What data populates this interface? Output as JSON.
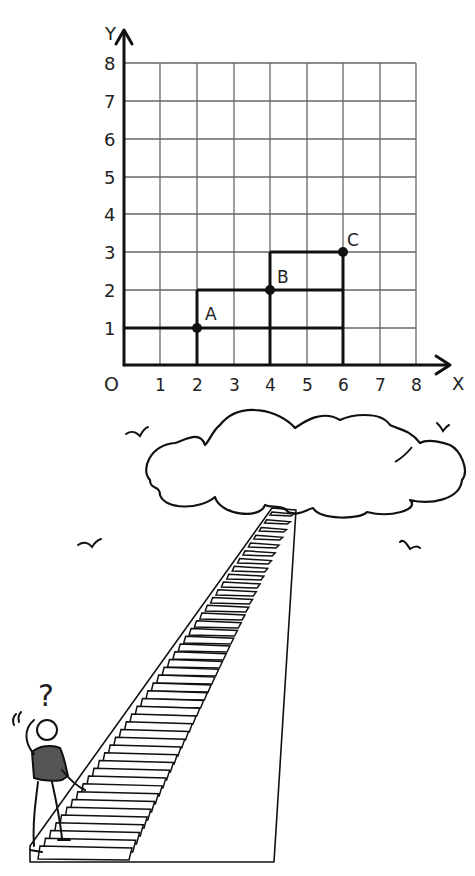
{
  "graph": {
    "axis_labels": {
      "x": "X",
      "y": "Y",
      "origin": "O"
    },
    "x_ticks": [
      "1",
      "2",
      "3",
      "4",
      "5",
      "6",
      "7",
      "8"
    ],
    "y_ticks": [
      "1",
      "2",
      "3",
      "4",
      "5",
      "6",
      "7",
      "8"
    ],
    "points": [
      {
        "label": "A",
        "x": 2,
        "y": 1
      },
      {
        "label": "B",
        "x": 4,
        "y": 2
      },
      {
        "label": "C",
        "x": 6,
        "y": 3
      }
    ]
  },
  "chart_data": {
    "type": "scatter",
    "title": "",
    "xlabel": "X",
    "ylabel": "Y",
    "xlim": [
      0,
      8
    ],
    "ylim": [
      0,
      8
    ],
    "grid": true,
    "x_tick_labels": [
      "O",
      "1",
      "2",
      "3",
      "4",
      "5",
      "6",
      "7",
      "8"
    ],
    "y_tick_labels": [
      "1",
      "2",
      "3",
      "4",
      "5",
      "6",
      "7",
      "8"
    ],
    "series": [
      {
        "name": "points",
        "x": [
          2,
          4,
          6
        ],
        "y": [
          1,
          2,
          3
        ],
        "labels": [
          "A",
          "B",
          "C"
        ]
      }
    ],
    "annotations": [
      "Rectangle from (0,0) to (2,1) with corner at A",
      "Rectangle from (2,1)... step outline: horizontal at y=1 from x=0 to 6, y=2 from x=2 to 6, y=3 from x=4 to 6; vertical at x=2 (0–2), x=4 (0–3), x=6 (0–3)"
    ]
  },
  "illustration": {
    "question_mark": "?",
    "description": "Person with scratching head climbing a long staircase toward a cloud, birds in sky"
  }
}
